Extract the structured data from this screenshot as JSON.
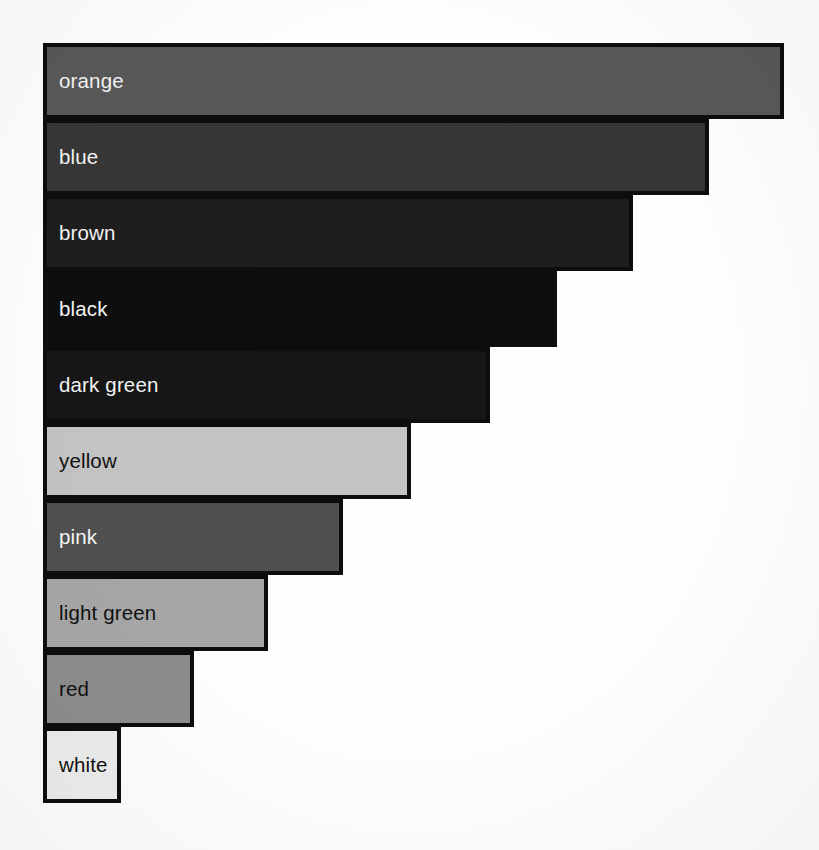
{
  "chart_data": {
    "type": "bar",
    "orientation": "horizontal",
    "title": "",
    "subtitle": "",
    "xlabel": "",
    "ylabel": "",
    "grid": false,
    "legend": false,
    "axes_visible": false,
    "tick_labels": [],
    "annotations": [],
    "note": "Grayscale scanned horizontal bar chart. Each bar is labelled in-place with a colour name; bar length encodes the value. Bars are sorted descending.",
    "categories": [
      "orange",
      "blue",
      "brown",
      "black",
      "dark green",
      "yellow",
      "pink",
      "light green",
      "red",
      "white"
    ],
    "values": [
      100,
      90,
      80,
      69,
      60,
      49,
      40,
      30,
      20,
      10
    ],
    "xlim": [
      0,
      100
    ],
    "bar_fills": [
      "#575757",
      "#343434",
      "#1b1b1b",
      "#0a0a0a",
      "#131313",
      "#c6c6c6",
      "#4e4e4e",
      "#a8a8a8",
      "#8d8d8d",
      "#f0f0f0"
    ],
    "bar_label_colors": [
      "#f2f2f2",
      "#f2f2f2",
      "#f2f2f2",
      "#f2f2f2",
      "#f2f2f2",
      "#111111",
      "#f6f6f6",
      "#111111",
      "#111111",
      "#111111"
    ],
    "bar_outline_color": "#0d0d0d",
    "background_color": "#fdfdfd"
  },
  "bars": [
    {
      "label": "orange",
      "width_px": 741,
      "fill": "#575757",
      "text": "#f2f2f2"
    },
    {
      "label": "blue",
      "width_px": 666,
      "fill": "#343434",
      "text": "#f2f2f2"
    },
    {
      "label": "brown",
      "width_px": 590,
      "fill": "#1b1b1b",
      "text": "#f2f2f2"
    },
    {
      "label": "black",
      "width_px": 514,
      "fill": "#0a0a0a",
      "text": "#f2f2f2"
    },
    {
      "label": "dark green",
      "width_px": 447,
      "fill": "#131313",
      "text": "#f2f2f2"
    },
    {
      "label": "yellow",
      "width_px": 368,
      "fill": "#c6c6c6",
      "text": "#111111"
    },
    {
      "label": "pink",
      "width_px": 300,
      "fill": "#4e4e4e",
      "text": "#f6f6f6"
    },
    {
      "label": "light green",
      "width_px": 225,
      "fill": "#a8a8a8",
      "text": "#111111"
    },
    {
      "label": "red",
      "width_px": 151,
      "fill": "#8d8d8d",
      "text": "#111111"
    },
    {
      "label": "white",
      "width_px": 78,
      "fill": "#f0f0f0",
      "text": "#111111"
    }
  ],
  "layout": {
    "left_px": 43,
    "top_px": 43,
    "bar_height_px": 76,
    "canvas_width_px": 819,
    "canvas_height_px": 850
  }
}
